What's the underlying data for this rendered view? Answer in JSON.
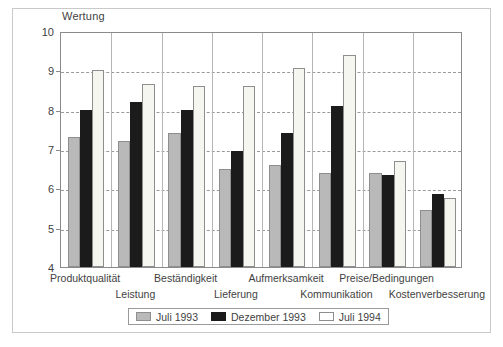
{
  "chart_data": {
    "type": "bar",
    "title": "",
    "subtitle": "",
    "xlabel": "",
    "ylabel": "Wertung",
    "ylim": [
      4,
      10
    ],
    "yticks": [
      4,
      5,
      6,
      7,
      8,
      9,
      10
    ],
    "grid": true,
    "grid_style": "dashed horizontal",
    "legend_position": "bottom",
    "categories": [
      "Produktqualität",
      "Leistung",
      "Beständigkeit",
      "Lieferung",
      "Aufmerksamkeit",
      "Kommunikation",
      "Preise/Bedingungen",
      "Kostenverbesserung"
    ],
    "series": [
      {
        "name": "Juli 1993",
        "color": "#b9b9b9",
        "values": [
          7.3,
          7.2,
          7.4,
          6.5,
          6.6,
          6.4,
          6.4,
          5.45
        ]
      },
      {
        "name": "Dezember 1993",
        "color": "#1b1b1b",
        "values": [
          8.0,
          8.2,
          8.0,
          6.95,
          7.4,
          8.1,
          6.35,
          5.85
        ]
      },
      {
        "name": "Juli 1994",
        "color": "#ffffff",
        "values": [
          9.0,
          8.65,
          8.6,
          8.6,
          9.05,
          9.4,
          6.7,
          5.75
        ]
      }
    ]
  },
  "figure": {
    "axis_title": "Wertung"
  }
}
